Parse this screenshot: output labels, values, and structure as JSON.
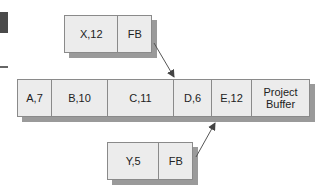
{
  "diagram": {
    "type": "critical-chain-buffers",
    "top_feeding_chain": {
      "cells": [
        {
          "label": "X,12",
          "width": 54
        },
        {
          "label": "FB",
          "width": 33
        }
      ],
      "arrow_target": "between C and D"
    },
    "main_chain": {
      "cells": [
        {
          "label": "A,7",
          "width": 34
        },
        {
          "label": "B,10",
          "width": 56
        },
        {
          "label": "C,11",
          "width": 66
        },
        {
          "label": "D,6",
          "width": 38
        },
        {
          "label": "E,12",
          "width": 40
        },
        {
          "label_line1": "Project",
          "label_line2": "Buffer",
          "width": 58
        }
      ]
    },
    "bottom_feeding_chain": {
      "cells": [
        {
          "label": "Y,5",
          "width": 52
        },
        {
          "label": "FB",
          "width": 33
        }
      ],
      "arrow_target": "between D and E"
    },
    "colors": {
      "box_fill": "#ececec",
      "border": "#8a8a8a",
      "shadow": "#9a9a9a",
      "arrow": "#555555"
    }
  }
}
